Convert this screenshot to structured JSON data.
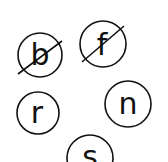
{
  "letters": [
    {
      "char": "b",
      "crossed": true
    },
    {
      "char": "f",
      "crossed": true
    },
    {
      "char": "r",
      "crossed": false
    },
    {
      "char": "n",
      "crossed": false
    },
    {
      "char": "s",
      "crossed": false
    }
  ],
  "colors": {
    "stroke": "#111111",
    "background": "#ffffff"
  }
}
